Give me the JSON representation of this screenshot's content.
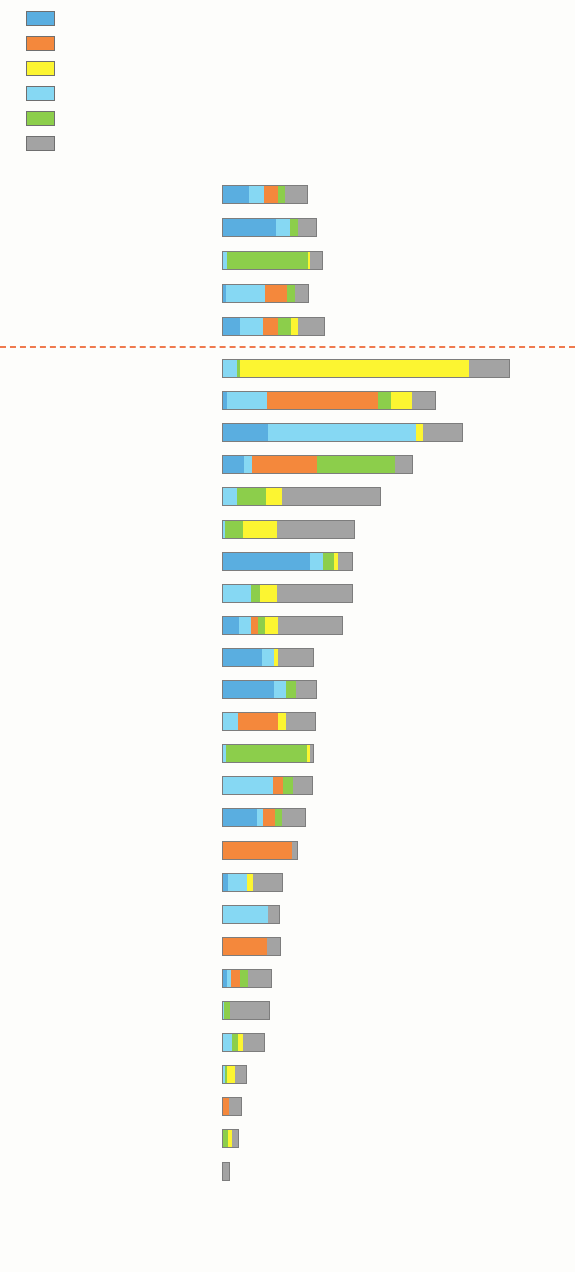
{
  "legend": {
    "items": [
      {
        "label": "Electronics and machinery",
        "color": "#5aaee0",
        "key": "electronics"
      },
      {
        "label": "Textiles and footwear",
        "color": "#f4883c",
        "key": "textiles"
      },
      {
        "label": "Tourism",
        "color": "#fcf531",
        "key": "tourism"
      },
      {
        "label": "Finance, trade, and business services",
        "color": "#86d8f3",
        "key": "finance"
      },
      {
        "label": "Food and commodities",
        "color": "#8cce4b",
        "key": "food"
      },
      {
        "label": "Other",
        "color": "#a3a3a3",
        "key": "other"
      }
    ]
  },
  "axis": {
    "xlabel": "%",
    "ticks": [
      "0",
      "5",
      "10",
      "15",
      "20",
      "25"
    ],
    "xmin": 0,
    "xmax": 25
  },
  "separator_color": "#ef7a4e",
  "chart_data": {
    "type": "bar",
    "orientation": "horizontal",
    "stacked": true,
    "title": "",
    "xlabel": "%",
    "ylabel": "",
    "xlim": [
      0,
      25
    ],
    "xticks": [
      0,
      5,
      10,
      15,
      20,
      25
    ],
    "grid": false,
    "legend_position": "top-left",
    "series": [
      {
        "name": "Electronics and machinery",
        "color": "#5aaee0"
      },
      {
        "name": "Textiles and footwear",
        "color": "#f4883c"
      },
      {
        "name": "Tourism",
        "color": "#fcf531"
      },
      {
        "name": "Finance, trade, and business services",
        "color": "#86d8f3"
      },
      {
        "name": "Food and commodities",
        "color": "#8cce4b"
      },
      {
        "name": "Other",
        "color": "#a3a3a3"
      }
    ],
    "group_regions": {
      "categories": [
        "Developing Asia",
        "East Asia excl. PRC",
        "Caucasus and Central Asia",
        "South Asia",
        "Southeast Asia"
      ],
      "values": [
        {
          "electronics": 1.95,
          "finance": 1.15,
          "tourism": 0.0,
          "textiles": 1.0,
          "food": 0.55,
          "other": 1.65,
          "total": 6.3
        },
        {
          "electronics": 4.0,
          "finance": 1.0,
          "tourism": 0.0,
          "textiles": 0.0,
          "food": 0.6,
          "other": 1.4,
          "total": 7.0
        },
        {
          "electronics": 0.0,
          "finance": 0.4,
          "food": 5.9,
          "tourism": 0.15,
          "textiles": 0.0,
          "other": 0.95,
          "total": 7.4
        },
        {
          "electronics": 0.3,
          "finance": 2.85,
          "textiles": 1.65,
          "food": 0.6,
          "tourism": 0.0,
          "other": 1.0,
          "total": 6.4
        },
        {
          "electronics": 1.35,
          "finance": 1.7,
          "textiles": 1.05,
          "food": 1.0,
          "tourism": 0.5,
          "other": 2.0,
          "total": 7.6
        }
      ]
    },
    "group_economies": {
      "categories": [
        "Maldives",
        "Cambodia",
        "Singapore",
        "Viet Nam",
        "Georgia",
        "Fiji",
        "Taipei,China",
        "Armenia",
        "Thailand",
        "Malaysia",
        "Republic of Korea",
        "Sri Lanka",
        "Kazakhstan",
        "India",
        "PRC",
        "Bangladesh",
        "Philippines",
        "Hong Kong, China",
        "Pakistan",
        "Indonesia",
        "Kyrgyz Republic",
        "Mongolia",
        "Bhutan",
        "Lao PDR",
        "Nepal",
        "Brunei Darussalam"
      ],
      "values": [
        {
          "name": "Maldives",
          "electronics": 0.0,
          "finance": 1.1,
          "food": 0.25,
          "textiles": 0.0,
          "tourism": 16.8,
          "other": 3.0,
          "total": 21.2
        },
        {
          "name": "Cambodia",
          "electronics": 0.35,
          "finance": 2.95,
          "textiles": 8.2,
          "food": 0.95,
          "tourism": 1.55,
          "other": 1.75,
          "total": 15.75
        },
        {
          "name": "Singapore",
          "electronics": 3.4,
          "finance": 10.9,
          "tourism": 0.45,
          "textiles": 0.0,
          "food": 0.0,
          "other": 3.0,
          "total": 17.75
        },
        {
          "name": "Viet Nam",
          "electronics": 1.6,
          "finance": 0.6,
          "textiles": 4.8,
          "food": 5.7,
          "tourism": 0.0,
          "other": 1.35,
          "total": 14.05
        },
        {
          "name": "Georgia",
          "electronics": 0.0,
          "finance": 1.1,
          "food": 2.15,
          "tourism": 1.15,
          "textiles": 0.0,
          "other": 7.3,
          "total": 11.7
        },
        {
          "name": "Fiji",
          "electronics": 0.0,
          "finance": 0.2,
          "food": 1.35,
          "tourism": 2.5,
          "textiles": 0.0,
          "other": 5.75,
          "total": 9.8
        },
        {
          "name": "Taipei,China",
          "electronics": 6.5,
          "finance": 0.95,
          "food": 0.8,
          "tourism": 0.25,
          "textiles": 0.0,
          "other": 1.1,
          "total": 9.6
        },
        {
          "name": "Armenia",
          "electronics": 0.0,
          "finance": 2.15,
          "food": 0.65,
          "tourism": 1.25,
          "textiles": 0.0,
          "other": 5.6,
          "total": 9.65
        },
        {
          "name": "Thailand",
          "electronics": 1.25,
          "finance": 0.9,
          "textiles": 0.5,
          "food": 0.5,
          "tourism": 0.95,
          "other": 4.8,
          "total": 8.9
        },
        {
          "name": "Malaysia",
          "electronics": 2.95,
          "finance": 0.9,
          "tourism": 0.3,
          "textiles": 0.0,
          "food": 0.0,
          "other": 2.65,
          "total": 6.8
        },
        {
          "name": "Republic of Korea",
          "electronics": 3.85,
          "finance": 0.85,
          "food": 0.75,
          "tourism": 0.0,
          "textiles": 0.0,
          "other": 1.55,
          "total": 7.0
        },
        {
          "name": "Sri Lanka",
          "electronics": 0.0,
          "finance": 1.15,
          "textiles": 2.95,
          "tourism": 0.6,
          "food": 0.0,
          "other": 2.2,
          "total": 6.9
        },
        {
          "name": "Kazakhstan",
          "electronics": 0.0,
          "finance": 0.3,
          "food": 5.95,
          "tourism": 0.2,
          "textiles": 0.0,
          "other": 0.3,
          "total": 6.75
        },
        {
          "name": "India",
          "electronics": 0.0,
          "finance": 3.75,
          "textiles": 0.75,
          "food": 0.75,
          "tourism": 0.0,
          "other": 1.45,
          "total": 6.7
        },
        {
          "name": "PRC",
          "electronics": 2.55,
          "finance": 0.45,
          "textiles": 0.9,
          "food": 0.5,
          "tourism": 0.0,
          "other": 1.75,
          "total": 6.15
        },
        {
          "name": "Bangladesh",
          "electronics": 0.0,
          "finance": 0.0,
          "textiles": 5.15,
          "food": 0.0,
          "tourism": 0.0,
          "other": 0.45,
          "total": 5.6
        },
        {
          "name": "Philippines",
          "electronics": 0.45,
          "finance": 1.4,
          "tourism": 0.4,
          "textiles": 0.0,
          "food": 0.0,
          "other": 2.25,
          "total": 4.5
        },
        {
          "name": "Hong Kong, China",
          "electronics": 0.0,
          "finance": 3.4,
          "textiles": 0.0,
          "food": 0.0,
          "tourism": 0.0,
          "other": 0.85,
          "total": 4.25
        },
        {
          "name": "Pakistan",
          "electronics": 0.0,
          "finance": 0.0,
          "textiles": 3.3,
          "food": 0.0,
          "tourism": 0.0,
          "other": 1.05,
          "total": 4.35
        },
        {
          "name": "Indonesia",
          "electronics": 0.35,
          "finance": 0.3,
          "textiles": 0.65,
          "food": 0.6,
          "tourism": 0.0,
          "other": 1.75,
          "total": 3.65
        },
        {
          "name": "Kyrgyz Republic",
          "electronics": 0.0,
          "finance": 0.15,
          "food": 0.45,
          "tourism": 0.0,
          "textiles": 0.0,
          "other": 2.95,
          "total": 3.55
        },
        {
          "name": "Mongolia",
          "electronics": 0.0,
          "finance": 0.75,
          "food": 0.45,
          "tourism": 0.35,
          "textiles": 0.0,
          "other": 1.65,
          "total": 3.2
        },
        {
          "name": "Bhutan",
          "electronics": 0.0,
          "finance": 0.25,
          "food": 0.15,
          "tourism": 0.55,
          "textiles": 0.0,
          "other": 0.9,
          "total": 1.85
        },
        {
          "name": "Lao PDR",
          "electronics": 0.0,
          "finance": 0.0,
          "textiles": 0.55,
          "food": 0.0,
          "tourism": 0.0,
          "other": 0.95,
          "total": 1.5
        },
        {
          "name": "Nepal",
          "electronics": 0.0,
          "finance": 0.1,
          "food": 0.35,
          "tourism": 0.25,
          "textiles": 0.0,
          "other": 0.55,
          "total": 1.25
        },
        {
          "name": "Brunei Darussalam",
          "electronics": 0.0,
          "finance": 0.0,
          "textiles": 0.0,
          "food": 0.0,
          "tourism": 0.0,
          "other": 0.6,
          "total": 0.6
        }
      ]
    }
  }
}
